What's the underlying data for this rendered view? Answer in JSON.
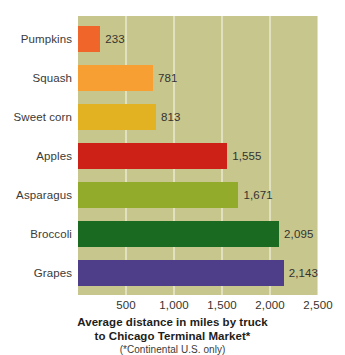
{
  "chart_data": {
    "type": "bar",
    "orientation": "horizontal",
    "title": "Average distance in miles by truck to Chicago Terminal Market*",
    "subtitle": "(*Continental U.S. only)",
    "xlabel": "",
    "ylabel": "",
    "xlim": [
      0,
      2500
    ],
    "grid": true,
    "legend": "none",
    "categories": [
      "Pumpkins",
      "Squash",
      "Sweet corn",
      "Apples",
      "Asparagus",
      "Broccoli",
      "Grapes"
    ],
    "values": [
      233,
      781,
      813,
      1555,
      1671,
      2095,
      2143
    ],
    "value_labels": [
      "233",
      "781",
      "813",
      "1,555",
      "1,671",
      "2,095",
      "2,143"
    ],
    "colors": [
      "#f0662a",
      "#f79f33",
      "#e2b222",
      "#cd2117",
      "#93ab2a",
      "#1b6a22",
      "#4e3e8a"
    ],
    "xticks": [
      500,
      1000,
      1500,
      2000,
      2500
    ],
    "xtick_labels": [
      "500",
      "1,000",
      "1,500",
      "2,000",
      "2,500"
    ],
    "plot_background": "#c7c68d",
    "gridline_color": "#e2e1bf",
    "page_background": "#ffffff"
  },
  "caption": {
    "line1": "Average distance in miles by truck",
    "line2": "to Chicago Terminal Market*",
    "note": "(*Continental U.S. only)"
  }
}
